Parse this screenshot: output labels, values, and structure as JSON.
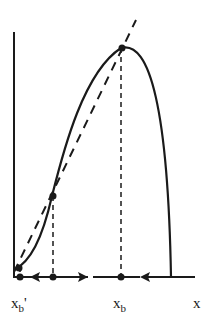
{
  "diagram": {
    "type": "phase-diagram",
    "colors": {
      "stroke": "#1a1a1a",
      "background": "#ffffff"
    },
    "curve": {
      "name": "hump-shaped map",
      "style": "solid"
    },
    "diagonal": {
      "name": "45-degree line",
      "style": "dashed"
    },
    "points": [
      {
        "id": "xb-prime",
        "label": "x",
        "sub": "b",
        "prime": "'",
        "stability": "stable"
      },
      {
        "id": "unstable",
        "label": "",
        "stability": "unstable"
      },
      {
        "id": "xb",
        "label": "x",
        "sub": "b",
        "stability": "stable"
      }
    ],
    "axis": {
      "x_label": "x"
    },
    "arrows": [
      {
        "from": "unstable",
        "to": "xb-prime",
        "direction": "left"
      },
      {
        "from": "unstable",
        "to": "xb",
        "direction": "right"
      },
      {
        "from": "right-end",
        "to": "xb",
        "direction": "left"
      }
    ]
  }
}
